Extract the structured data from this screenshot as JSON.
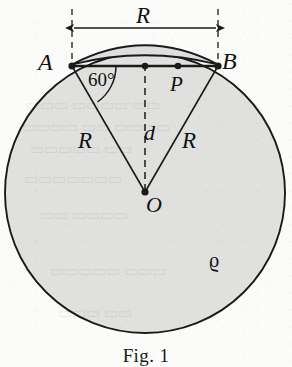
{
  "figure": {
    "type": "geometry-diagram",
    "caption": "Fig. 1",
    "points": {
      "A": {
        "label": "A",
        "x": 72,
        "y": 66
      },
      "B": {
        "label": "B",
        "x": 218,
        "y": 66
      },
      "P": {
        "label": "P",
        "x": 178,
        "y": 66
      },
      "O": {
        "label": "O",
        "x": 145,
        "y": 193
      },
      "M": {
        "label": "",
        "x": 145,
        "y": 66
      }
    },
    "labels": {
      "chord_length": "R",
      "radius_left": "R",
      "radius_right": "R",
      "distance": "d",
      "angle": "60°",
      "density": "ϱ"
    },
    "colors": {
      "ink": "#1a1a1a",
      "disk_fill": "#e2e2e0",
      "cap_fill": "#dcdcda",
      "paper": "#fbfbfa"
    },
    "circle": {
      "cx": 145,
      "cy": 193,
      "r": 140
    },
    "annotations": {
      "dimension_arrow": "R",
      "dashed_vertical": "d",
      "angle_at_A": "60°"
    }
  }
}
